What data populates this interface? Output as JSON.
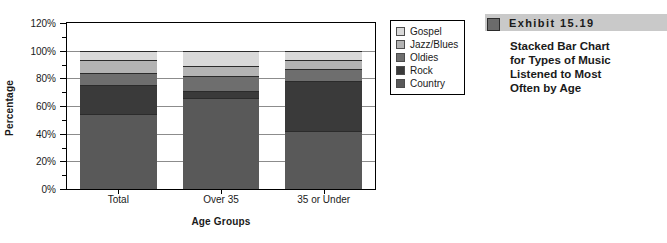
{
  "chart_data": {
    "type": "bar",
    "stacked": true,
    "title": "",
    "xlabel": "Age Groups",
    "ylabel": "Percentage",
    "categories": [
      "Total",
      "Over 35",
      "35 or Under"
    ],
    "ylim": [
      0,
      120
    ],
    "ytick_labels": [
      "0%",
      "20%",
      "40%",
      "60%",
      "80%",
      "100%",
      "120%"
    ],
    "ytick_values": [
      0,
      20,
      40,
      60,
      80,
      100,
      120
    ],
    "yminor_values": [
      10,
      30,
      50,
      70,
      90,
      110
    ],
    "grid": true,
    "grid_axis": "y",
    "legend_position": "right-outside",
    "stack_order_bottom_to_top": [
      "Country",
      "Rock",
      "Oldies",
      "Jazz/Blues",
      "Gospel"
    ],
    "series": [
      {
        "name": "Country",
        "values": [
          54,
          66,
          42
        ],
        "color": "#595959"
      },
      {
        "name": "Rock",
        "values": [
          21,
          5,
          36
        ],
        "color": "#3a3a3a"
      },
      {
        "name": "Oldies",
        "values": [
          9,
          11,
          8.5
        ],
        "color": "#6e6e6e"
      },
      {
        "name": "Jazz/Blues",
        "values": [
          9,
          7,
          7
        ],
        "color": "#b3b3b3"
      },
      {
        "name": "Gospel",
        "values": [
          7,
          11,
          6.5
        ],
        "color": "#d9d9d9"
      }
    ],
    "cumulative_tops": {
      "Total": [
        54,
        75,
        84,
        93,
        100
      ],
      "Over 35": [
        66,
        71,
        82,
        89,
        100
      ],
      "35 or Under": [
        42,
        78,
        86.5,
        93.5,
        100
      ]
    },
    "legend_entries": [
      {
        "label": "Gospel",
        "color": "#d9d9d9"
      },
      {
        "label": "Jazz/Blues",
        "color": "#b3b3b3"
      },
      {
        "label": "Oldies",
        "color": "#6e6e6e"
      },
      {
        "label": "Rock",
        "color": "#3a3a3a"
      },
      {
        "label": "Country",
        "color": "#595959"
      }
    ]
  },
  "exhibit": {
    "number_label": "Exhibit  15.19",
    "header_bg": "#c9c9c9",
    "marker_color": "#6b6b6b",
    "caption_lines": [
      "Stacked Bar Chart",
      "for Types of Music",
      "Listened to Most",
      "Often by Age"
    ]
  }
}
